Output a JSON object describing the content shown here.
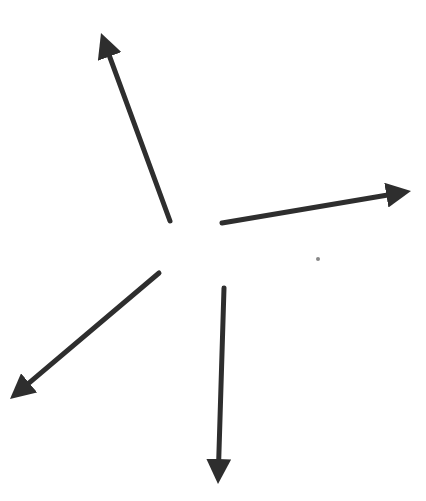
{
  "canvas": {
    "width": 426,
    "height": 501,
    "background": "#ffffff"
  },
  "stroke_color": "#2e2e2e",
  "arrows": [
    {
      "name": "arrow-up-left",
      "x1": 170,
      "y1": 221,
      "x2": 101,
      "y2": 33
    },
    {
      "name": "arrow-right",
      "x1": 222,
      "y1": 223,
      "x2": 411,
      "y2": 191
    },
    {
      "name": "arrow-down-left",
      "x1": 159,
      "y1": 273,
      "x2": 10,
      "y2": 399
    },
    {
      "name": "arrow-down",
      "x1": 224,
      "y1": 288,
      "x2": 218,
      "y2": 484
    }
  ],
  "dot": {
    "x": 318,
    "y": 259,
    "r": 2
  }
}
